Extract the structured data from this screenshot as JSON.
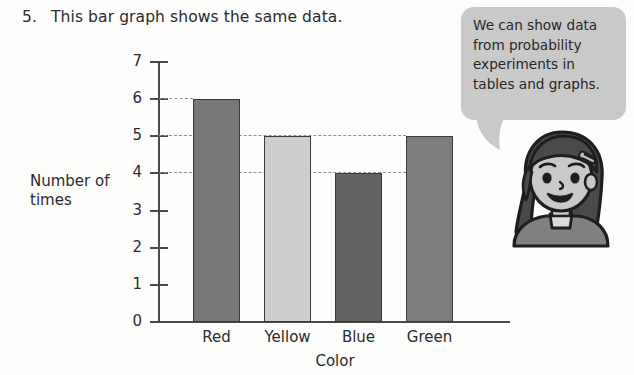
{
  "question": {
    "number": "5.",
    "text": "This bar graph shows the same data."
  },
  "speech_bubble": {
    "text": "We can show data from probability experiments in tables and graphs."
  },
  "character": {
    "name": "girl-character"
  },
  "chart_data": {
    "type": "bar",
    "title": "",
    "categories": [
      "Red",
      "Yellow",
      "Blue",
      "Green"
    ],
    "values": [
      6,
      5,
      4,
      5
    ],
    "bar_colors": [
      "#787878",
      "#cdcdcd",
      "#636363",
      "#7d7d7d"
    ],
    "xlabel": "Color",
    "ylabel": "Number of times",
    "ylim": [
      0,
      7
    ],
    "yticks": [
      "0",
      "1",
      "2",
      "3",
      "4",
      "5",
      "6",
      "7"
    ],
    "grid": "dashed gridlines at y = 4, 5, 6 extending from axis to each bar",
    "gridlines": [
      6,
      5,
      4
    ],
    "legend": "none"
  },
  "colors": {
    "axis": "#4a4a4a",
    "gridline": "#8f8f8f",
    "bar_outline": "#3a3a3a",
    "bubble": "#c9c9c9",
    "text": "#2b2b2b",
    "page_background": "#fdfdfc"
  }
}
